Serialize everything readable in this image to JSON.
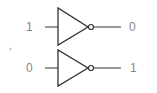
{
  "diagram": {
    "stroke_color": "#333333",
    "label_color": "#888888",
    "gates": [
      {
        "type": "NOT",
        "input_label": "1",
        "output_label": "0"
      },
      {
        "type": "NOT",
        "input_label": "0",
        "output_label": "1"
      }
    ],
    "stray_mark": ","
  }
}
